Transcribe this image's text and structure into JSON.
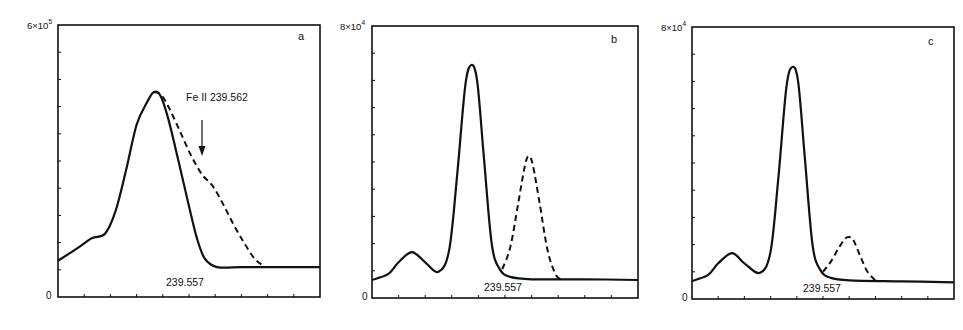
{
  "figure": {
    "panels": [
      {
        "id": "a",
        "panel_label": "a",
        "y_max_base": "6×10",
        "y_max_exp": "5",
        "y_min_label": "0",
        "peak_label": "239.557",
        "annotation": "Fe II  239.562"
      },
      {
        "id": "b",
        "panel_label": "b",
        "y_max_base": "8×10",
        "y_max_exp": "4",
        "y_min_label": "0",
        "peak_label": "239.557"
      },
      {
        "id": "c",
        "panel_label": "c",
        "y_max_base": "8×10",
        "y_max_exp": "4",
        "y_min_label": "0",
        "peak_label": "239.557"
      }
    ]
  },
  "chart_data": [
    {
      "type": "line",
      "panel": "a",
      "title": "",
      "xlabel": "",
      "ylabel": "",
      "xlim": [
        0,
        10
      ],
      "ylim": [
        0,
        600000
      ],
      "y_tick_labels": [
        "0",
        "6×10^5"
      ],
      "x_ticks": 10,
      "y_ticks": 10,
      "grid": false,
      "annotations": [
        {
          "text": "Fe II 239.562",
          "arrow_to": [
            5.5,
            260000
          ]
        },
        {
          "text": "239.557",
          "at": [
            4.1,
            40000
          ]
        },
        {
          "text": "a",
          "position": "top-right"
        }
      ],
      "series": [
        {
          "name": "solid",
          "style": "solid",
          "x": [
            0,
            0.8,
            1.3,
            1.8,
            2.2,
            2.6,
            3.0,
            3.4,
            3.66,
            3.9,
            4.2,
            4.6,
            5.0,
            5.3,
            5.6,
            6.07,
            7,
            8,
            10
          ],
          "y": [
            80000,
            110000,
            130000,
            140000,
            190000,
            280000,
            380000,
            430000,
            452000,
            445000,
            395000,
            300000,
            200000,
            130000,
            85000,
            66000,
            66000,
            66000,
            66000
          ]
        },
        {
          "name": "dashed",
          "style": "dashed",
          "x": [
            3.66,
            3.95,
            4.3,
            4.7,
            5.1,
            5.5,
            5.9,
            6.3,
            6.7,
            7.1,
            7.5,
            7.9
          ],
          "y": [
            452000,
            445000,
            410000,
            360000,
            310000,
            270000,
            245000,
            205000,
            160000,
            120000,
            85000,
            66000
          ]
        }
      ]
    },
    {
      "type": "line",
      "panel": "b",
      "title": "",
      "xlabel": "",
      "ylabel": "",
      "xlim": [
        0,
        10
      ],
      "ylim": [
        0,
        80000
      ],
      "y_tick_labels": [
        "0",
        "8×10^4"
      ],
      "x_ticks": 10,
      "y_ticks": 10,
      "grid": false,
      "annotations": [
        {
          "text": "239.557",
          "at": [
            4.2,
            2000
          ]
        },
        {
          "text": "b",
          "position": "top-right"
        }
      ],
      "series": [
        {
          "name": "solid",
          "style": "solid",
          "x": [
            0,
            0.6,
            1.0,
            1.5,
            2.0,
            2.5,
            2.9,
            3.2,
            3.5,
            3.72,
            3.95,
            4.2,
            4.5,
            4.8,
            5.2,
            6,
            8,
            10
          ],
          "y": [
            5300,
            7000,
            10500,
            13500,
            10500,
            7700,
            14000,
            36000,
            62000,
            68500,
            64000,
            42000,
            16000,
            8500,
            6200,
            5500,
            5500,
            5300
          ]
        },
        {
          "name": "dashed",
          "style": "dashed",
          "x": [
            4.9,
            5.2,
            5.5,
            5.75,
            5.9,
            6.05,
            6.3,
            6.6,
            6.9,
            7.1
          ],
          "y": [
            8500,
            15000,
            28000,
            39000,
            41800,
            39000,
            28000,
            14000,
            7000,
            5500
          ]
        }
      ]
    },
    {
      "type": "line",
      "panel": "c",
      "title": "",
      "xlabel": "",
      "ylabel": "",
      "xlim": [
        0,
        10
      ],
      "ylim": [
        0,
        80000
      ],
      "y_tick_labels": [
        "0",
        "8×10^4"
      ],
      "x_ticks": 10,
      "y_ticks": 10,
      "grid": false,
      "annotations": [
        {
          "text": "239.557",
          "at": [
            4.2,
            2000
          ]
        },
        {
          "text": "c",
          "position": "top-right"
        }
      ],
      "series": [
        {
          "name": "solid",
          "style": "solid",
          "x": [
            0,
            0.6,
            1.0,
            1.53,
            2.0,
            2.6,
            3.0,
            3.3,
            3.6,
            3.82,
            4.05,
            4.3,
            4.6,
            4.9,
            5.3,
            6,
            8,
            10
          ],
          "y": [
            5300,
            7000,
            10500,
            13500,
            10500,
            7700,
            14000,
            36000,
            62000,
            68200,
            64000,
            42000,
            16000,
            8500,
            6200,
            5500,
            5200,
            4900
          ]
        },
        {
          "name": "dashed",
          "style": "dashed",
          "x": [
            5.0,
            5.3,
            5.6,
            5.85,
            6.0,
            6.15,
            6.4,
            6.7,
            7.0
          ],
          "y": [
            8000,
            11000,
            15000,
            17800,
            18200,
            17500,
            13000,
            8000,
            5500
          ]
        }
      ]
    }
  ]
}
